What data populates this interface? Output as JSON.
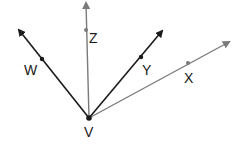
{
  "diagram": {
    "type": "rays from a common vertex",
    "vertex": {
      "label": "V",
      "x": 89,
      "y": 118,
      "label_x": 84,
      "label_y": 137
    },
    "rays": [
      {
        "name": "VW",
        "label": "W",
        "tip": [
          19,
          30
        ],
        "point": [
          42,
          59
        ],
        "label_pos": [
          24,
          75
        ],
        "color": "#1a1a1a"
      },
      {
        "name": "VZ",
        "label": "Z",
        "tip": [
          86,
          3
        ],
        "point": [
          86,
          30
        ],
        "label_pos": [
          89,
          43
        ],
        "color": "#7a7a7a"
      },
      {
        "name": "VY",
        "label": "Y",
        "tip": [
          162,
          31
        ],
        "point": [
          141,
          57
        ],
        "label_pos": [
          142,
          75
        ],
        "color": "#1a1a1a"
      },
      {
        "name": "VX",
        "label": "X",
        "tip": [
          229,
          42
        ],
        "point": [
          188,
          63
        ],
        "label_pos": [
          184,
          83
        ],
        "color": "#7a7a7a"
      }
    ]
  }
}
